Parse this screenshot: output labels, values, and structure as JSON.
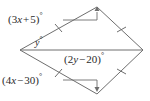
{
  "figure": {
    "shape": "rhombus",
    "stroke_color": "#6e6e6e",
    "text_color": "#2b2b2b",
    "width": 150,
    "height": 101,
    "vertices": {
      "left": {
        "x": 20,
        "y": 50
      },
      "top": {
        "x": 97,
        "y": 7
      },
      "right": {
        "x": 143,
        "y": 50
      },
      "bottom": {
        "x": 97,
        "y": 94
      }
    },
    "diagonal": {
      "from": "left",
      "to": "right"
    },
    "tick_marks": 4
  },
  "labels": {
    "top_left_angle": {
      "full": "(3x + 5)°",
      "open": "(",
      "coef": "3",
      "var": "x",
      "op": "+",
      "const": "5",
      "close": ")",
      "degree": "°"
    },
    "bottom_left_angle": {
      "full": "(4x − 30)°",
      "open": "(",
      "coef": "4",
      "var": "x",
      "op": "−",
      "const": "30",
      "close": ")",
      "degree": "°"
    },
    "center_angle": {
      "full": "(2y − 20)°",
      "open": "(",
      "coef": "2",
      "var": "y",
      "op": "−",
      "const": "20",
      "close": ")",
      "degree": "°"
    },
    "y_angle": {
      "full": "y°",
      "var": "y",
      "degree": "°"
    }
  }
}
